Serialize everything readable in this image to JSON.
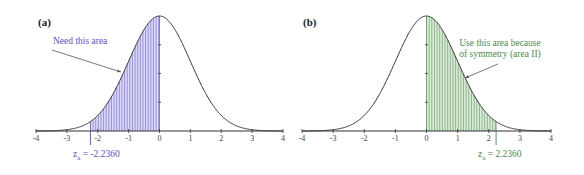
{
  "figure": {
    "panels": [
      {
        "label": "(a)",
        "accent": "#5a4fcf",
        "fill": "#dcdaf5",
        "hatch": "#7a70d8",
        "annotation": [
          "Need this area"
        ],
        "z_label": "z",
        "z_sub": "a",
        "z_value_text": " = -2.2360"
      },
      {
        "label": "(b)",
        "accent": "#4a8a4a",
        "fill": "#dcebd8",
        "hatch": "#6aa06a",
        "annotation": [
          "Use this area because",
          "of symmetry (area II)"
        ],
        "z_label": "z",
        "z_sub": "a",
        "z_value_text": " = 2.2360"
      }
    ],
    "x_ticks": [
      "-4",
      "-3",
      "-2",
      "-1",
      "0",
      "1",
      "2",
      "3",
      "4"
    ]
  },
  "chart_data": [
    {
      "type": "area",
      "title": "(a)",
      "description": "Standard normal density curve with shaded area from z = -2.2360 to 0",
      "xlabel": "",
      "ylabel": "",
      "xlim": [
        -4,
        4
      ],
      "x_ticks": [
        -4,
        -3,
        -2,
        -1,
        0,
        1,
        2,
        3,
        4
      ],
      "curve": "standard normal pdf",
      "shaded_region": [
        -2.236,
        0
      ],
      "annotations": [
        {
          "text": "Need this area",
          "points_to": "shaded region"
        },
        {
          "text": "z_a = -2.2360",
          "x": -2.236
        }
      ],
      "grid": false
    },
    {
      "type": "area",
      "title": "(b)",
      "description": "Standard normal density curve with shaded area from 0 to z = 2.2360",
      "xlabel": "",
      "ylabel": "",
      "xlim": [
        -4,
        4
      ],
      "x_ticks": [
        -4,
        -3,
        -2,
        -1,
        0,
        1,
        2,
        3,
        4
      ],
      "curve": "standard normal pdf",
      "shaded_region": [
        0,
        2.236
      ],
      "annotations": [
        {
          "text": "Use this area because of symmetry (area II)",
          "points_to": "shaded region"
        },
        {
          "text": "z_a = 2.2360",
          "x": 2.236
        }
      ],
      "grid": false
    }
  ]
}
